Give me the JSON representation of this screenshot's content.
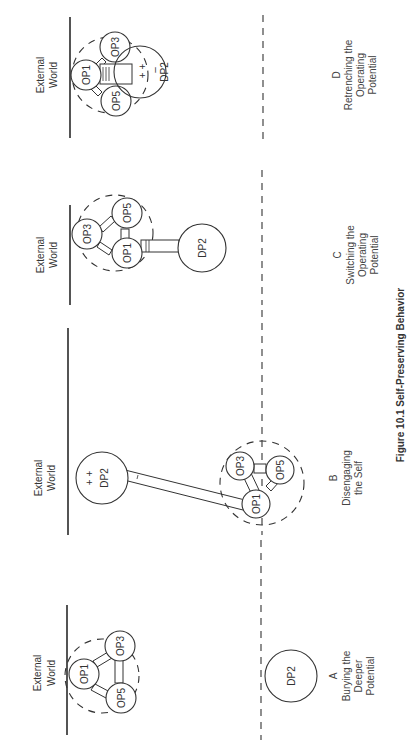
{
  "figure": {
    "title": "Figure 10.1  Self-Preserving Behavior",
    "external_world_label_line1": "External",
    "external_world_label_line2": "World"
  },
  "panels": [
    {
      "letter": "A",
      "caption_lines": [
        "Burying the",
        "Deeper",
        "Potential"
      ],
      "nodes": [
        "OP1",
        "OP3",
        "OP5",
        "DP2"
      ]
    },
    {
      "letter": "B",
      "caption_lines": [
        "Disengaging",
        "the Self"
      ],
      "nodes": [
        "DP2",
        "OP1",
        "OP3",
        "OP5"
      ],
      "dp2_mark": "+ +"
    },
    {
      "letter": "C",
      "caption_lines": [
        "Switching the",
        "Operating",
        "Potential"
      ],
      "nodes": [
        "OP3",
        "OP5",
        "OP1",
        "DP2"
      ]
    },
    {
      "letter": "D",
      "caption_lines": [
        "Retrenching the",
        "Operating",
        "Potential"
      ],
      "nodes": [
        "OP1",
        "OP3",
        "OP5",
        "DP2"
      ],
      "dp2_mark": "+ +",
      "dp2_minus": "–"
    }
  ]
}
